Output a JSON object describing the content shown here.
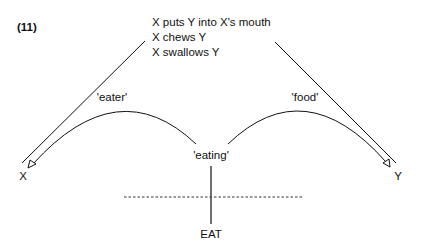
{
  "example_number": "(11)",
  "definition": {
    "lines": [
      "X puts Y into X's mouth",
      "X chews Y",
      "X swallows Y"
    ]
  },
  "roles": {
    "left_arc_label": "'eater'",
    "right_arc_label": "'food'"
  },
  "nodes": {
    "left": "X",
    "right": "Y",
    "center": "'eating'",
    "bottom": "EAT"
  },
  "colors": {
    "ink": "#111111",
    "background": "#ffffff"
  }
}
